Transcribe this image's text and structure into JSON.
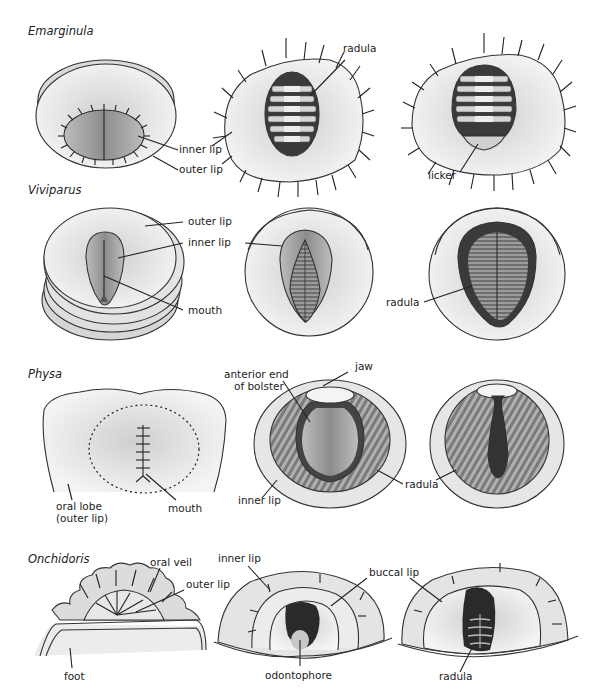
{
  "figure": {
    "rows": [
      {
        "taxon": "Emarginula",
        "labels": {
          "inner_lip": "inner lip",
          "outer_lip": "outer lip",
          "radula": "radula",
          "licker": "licker"
        }
      },
      {
        "taxon": "Viviparus",
        "labels": {
          "outer_lip": "outer lip",
          "inner_lip": "inner lip",
          "mouth": "mouth",
          "radula": "radula"
        }
      },
      {
        "taxon": "Physa",
        "labels": {
          "oral_lobe_1": "oral lobe",
          "oral_lobe_2": "(outer lip)",
          "mouth": "mouth",
          "anterior_1": "anterior end",
          "anterior_2": "of bolster",
          "jaw": "jaw",
          "inner_lip": "inner lip",
          "radula_mid": "radula"
        }
      },
      {
        "taxon": "Onchidoris",
        "labels": {
          "oral_veil": "oral veil",
          "outer_lip": "outer lip",
          "foot": "foot",
          "inner_lip": "inner lip",
          "buccal_lip": "buccal lip",
          "odontophore": "odontophore",
          "radula": "radula"
        }
      }
    ]
  }
}
